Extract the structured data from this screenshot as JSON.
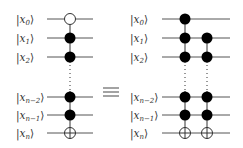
{
  "diagram": {
    "type": "quantum-circuit-equivalence",
    "equivalence_symbol": "≡",
    "colors": {
      "wire": "#555555",
      "control_fill": "#000000",
      "open_fill": "#ffffff",
      "text": "#333333"
    },
    "left_circuit": {
      "qubits": [
        {
          "base": "x",
          "sub": "0",
          "y": 19
        },
        {
          "base": "x",
          "sub": "1",
          "y": 38
        },
        {
          "base": "x",
          "sub": "2",
          "y": 57
        },
        {
          "base": "x",
          "sub": "n−2",
          "y": 97
        },
        {
          "base": "x",
          "sub": "n−1",
          "y": 115
        },
        {
          "base": "x",
          "sub": "n",
          "y": 133
        }
      ],
      "gates": [
        {
          "x": 70,
          "controls": [
            {
              "row": 0,
              "type": "open"
            },
            {
              "row": 1,
              "type": "filled"
            },
            {
              "row": 2,
              "type": "filled"
            },
            {
              "row": 3,
              "type": "filled"
            },
            {
              "row": 4,
              "type": "filled"
            }
          ],
          "target_row": 5
        }
      ]
    },
    "right_circuit": {
      "qubits": [
        {
          "base": "x",
          "sub": "0",
          "y": 19
        },
        {
          "base": "x",
          "sub": "1",
          "y": 38
        },
        {
          "base": "x",
          "sub": "2",
          "y": 57
        },
        {
          "base": "x",
          "sub": "n−2",
          "y": 97
        },
        {
          "base": "x",
          "sub": "n−1",
          "y": 115
        },
        {
          "base": "x",
          "sub": "n",
          "y": 133
        }
      ],
      "gates": [
        {
          "x": 185,
          "controls": [
            {
              "row": 0,
              "type": "filled"
            },
            {
              "row": 1,
              "type": "filled"
            },
            {
              "row": 2,
              "type": "filled"
            },
            {
              "row": 3,
              "type": "filled"
            },
            {
              "row": 4,
              "type": "filled"
            }
          ],
          "target_row": 5
        },
        {
          "x": 207,
          "controls": [
            {
              "row": 1,
              "type": "filled"
            },
            {
              "row": 2,
              "type": "filled"
            },
            {
              "row": 3,
              "type": "filled"
            },
            {
              "row": 4,
              "type": "filled"
            }
          ],
          "target_row": 5
        }
      ]
    }
  }
}
